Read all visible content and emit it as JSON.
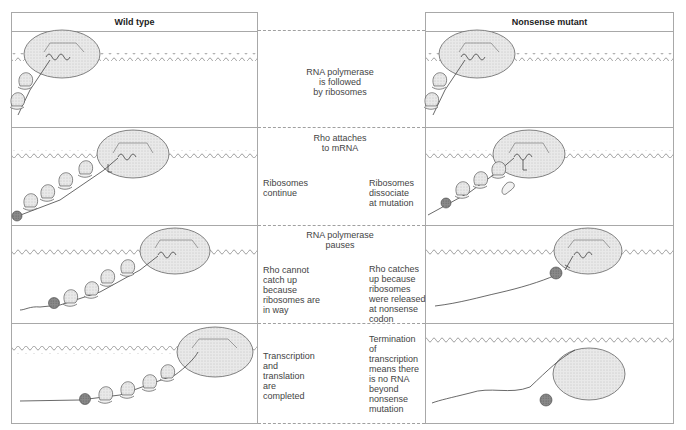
{
  "columns": {
    "left_header": "Wild type",
    "right_header": "Nonsense mutant"
  },
  "rows": [
    {
      "center_caption": "RNA polymerase\nis followed\nby ribosomes",
      "wild_note": "",
      "mutant_note": ""
    },
    {
      "center_caption": "Rho attaches\nto mRNA",
      "wild_note": "Ribosomes\ncontinue",
      "mutant_note": "Ribosomes\ndissociate\nat mutation"
    },
    {
      "center_caption": "RNA polymerase\npauses",
      "wild_note": "Rho cannot\ncatch up\nbecause\nribosomes are\nin way",
      "mutant_note": "Rho catches\nup because\nribosomes\nwere released\nat nonsense\ncodon"
    },
    {
      "center_caption": "",
      "wild_note": "Transcription\nand\ntranslation\nare\ncompleted",
      "mutant_note": "Termination\nof\ntranscription\nmeans there\nis no RNA\nbeyond\nnonsense\nmutation"
    }
  ],
  "legend_icons": {
    "polymerase": "rna-polymerase-ellipse-icon",
    "ribosome": "ribosome-icon",
    "rho": "rho-factor-icon",
    "dna": "dna-wave-icon",
    "mrna": "mrna-strand-icon"
  },
  "colors": {
    "border": "#a8a8a8",
    "polymerase_fill": "#e6e6e6",
    "rho_fill": "#7a7a7a",
    "ribosome_fill": "#e8e8e8",
    "line": "#444444"
  }
}
